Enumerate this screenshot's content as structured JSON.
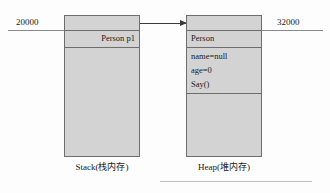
{
  "diagram": {
    "colors": {
      "box_fill": "#d3d3d3",
      "box_border": "#6e6e6e",
      "arrow": "#3a3a3a",
      "leader_line": "#8a8a8a",
      "bottom_rule": "#bdbdbd",
      "text": "#1a1a1a",
      "background": "#fdfdfd"
    },
    "addresses": {
      "stack_address": "20000",
      "heap_address": "32000"
    },
    "stack": {
      "caption": "Stack(栈内存)",
      "variable_label": "Person p1"
    },
    "heap": {
      "caption": "Heap(堆内存)",
      "class_label": "Person",
      "members": [
        "name=null",
        "age=0",
        "Say()"
      ]
    },
    "arrow": {
      "label": "",
      "direction": "stack-to-heap"
    }
  }
}
